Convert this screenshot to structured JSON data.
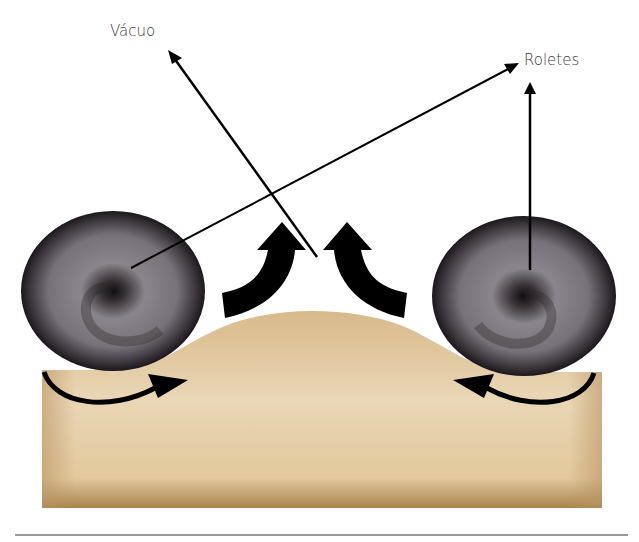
{
  "diagram": {
    "labels": {
      "vacuum": "Vácuo",
      "rollers": "Roletes"
    },
    "colors": {
      "body_light": "#e8d3ae",
      "body_dark": "#b08a55",
      "roller_dark": "#1a1518",
      "roller_mid": "#7d7880",
      "arrow": "#000000",
      "divider": "#9a9a9a"
    },
    "elements": [
      "tan-body-with-bulge",
      "left-roller",
      "right-roller",
      "up-arrow-left",
      "up-arrow-right",
      "curved-arrow-left",
      "curved-arrow-right",
      "vacuum-pointer",
      "rollers-pointer-left",
      "rollers-pointer-right",
      "bottom-divider"
    ]
  }
}
